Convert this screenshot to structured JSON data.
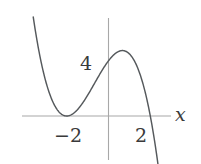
{
  "figure": {
    "kind": "cubic-function-graph",
    "background_color": "#ffffff",
    "axis_color": "#a8a8a8",
    "curve_color": "#55595c",
    "text_color": "#3a3a3a"
  },
  "labels": {
    "y_tick_4": "4",
    "x_tick_neg2": "−2",
    "x_tick_2": "2",
    "x_axis": "x"
  },
  "chart_data": {
    "type": "line",
    "title": "",
    "xlabel": "x",
    "ylabel": "",
    "grid": false,
    "legend": null,
    "axes": {
      "x_axis_visible": true,
      "y_axis_visible": true,
      "x_tick_labels": [
        "−2",
        "2"
      ],
      "x_tick_values": [
        -2,
        2
      ],
      "y_tick_labels": [
        "4"
      ],
      "y_tick_values": [
        4
      ],
      "xlim": [
        -3.6,
        3.0
      ],
      "ylim": [
        -4.5,
        11.0
      ]
    },
    "annotations": [
      {
        "text": "4",
        "x": -0.45,
        "y": 4.0,
        "role": "y-intercept-tick-label"
      },
      {
        "text": "−2",
        "x": -2.0,
        "y": -1.4,
        "role": "x-tick-label"
      },
      {
        "text": "2",
        "x": 2.0,
        "y": -1.4,
        "role": "x-tick-label"
      },
      {
        "text": "x",
        "x": 3.0,
        "y": 0.55,
        "role": "axis-label"
      }
    ],
    "features": {
      "roots": [
        -2,
        2
      ],
      "double_root": -2,
      "y_intercept": 4,
      "local_minimum": {
        "x": -2,
        "y": 0
      },
      "local_maximum": {
        "x": 0.667,
        "y": 5.185
      },
      "end_behavior": {
        "left": "+infinity",
        "right": "-infinity"
      }
    },
    "series": [
      {
        "name": "y = -(x+2)^2(x-2)/2",
        "x": [
          -3.55,
          -3.4,
          -3.2,
          -3.0,
          -2.8,
          -2.6,
          -2.4,
          -2.2,
          -2.0,
          -1.8,
          -1.6,
          -1.4,
          -1.2,
          -1.0,
          -0.8,
          -0.6,
          -0.4,
          -0.2,
          0.0,
          0.2,
          0.4,
          0.6,
          0.8,
          1.0,
          1.2,
          1.4,
          1.6,
          1.8,
          2.0,
          2.2,
          2.4,
          2.6,
          2.75
        ],
        "y": [
          11.06,
          9.07,
          7.13,
          5.0,
          3.07,
          1.66,
          0.7,
          0.17,
          0.0,
          0.15,
          0.58,
          1.22,
          2.02,
          2.92,
          3.86,
          4.78,
          5.62,
          6.32,
          4.0,
          6.95,
          6.34,
          5.62,
          5.04,
          4.5,
          3.58,
          2.45,
          1.3,
          0.41,
          0.0,
          0.36,
          1.72,
          4.37,
          7.02
        ],
        "formula": "y = -0.5*(x+2)^2*(x-2)",
        "color": "#55595c"
      }
    ]
  }
}
